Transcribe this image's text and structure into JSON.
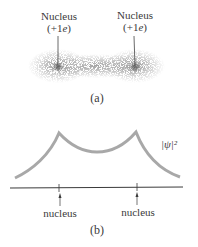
{
  "panel_a": {
    "nucleus_left": {
      "label": "Nucleus",
      "charge": "(+1e)"
    },
    "nucleus_right": {
      "label": "Nucleus",
      "charge": "(+1e)"
    },
    "caption": "(a)"
  },
  "panel_b": {
    "curve_label": "|ψ|²",
    "axis_labels": [
      "nucleus",
      "nucleus"
    ],
    "caption": "(b)"
  },
  "colors": {
    "curve": "#a8a8a8",
    "axis": "#3a3a3a",
    "cloud": "#6e6e6e"
  }
}
